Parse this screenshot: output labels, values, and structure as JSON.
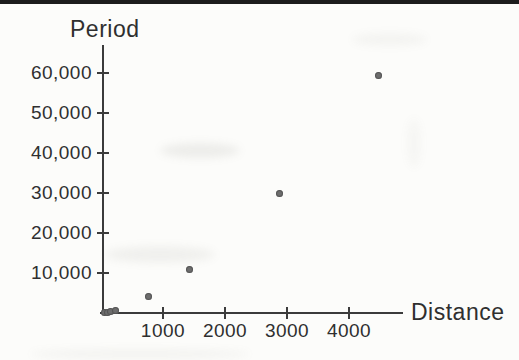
{
  "page": {
    "background_color": "#fcfcfa",
    "top_rule_color": "#1c1c1c",
    "text_color": "#2f2f2f",
    "axis_color": "#3b3b3b"
  },
  "chart_data": {
    "type": "scatter",
    "title": "",
    "xlabel": "Distance",
    "ylabel": "Period",
    "xlim": [
      0,
      4870
    ],
    "ylim": [
      0,
      67000
    ],
    "grid": false,
    "legend": false,
    "point_color": "#6e6e6e",
    "x_ticks": [
      {
        "value": 1000,
        "label": "1000"
      },
      {
        "value": 2000,
        "label": "2000"
      },
      {
        "value": 3000,
        "label": "3000"
      },
      {
        "value": 4000,
        "label": "4000"
      }
    ],
    "y_ticks": [
      {
        "value": 10000,
        "label": "10,000"
      },
      {
        "value": 20000,
        "label": "20,000"
      },
      {
        "value": 30000,
        "label": "30,000"
      },
      {
        "value": 40000,
        "label": "40,000"
      },
      {
        "value": 50000,
        "label": "50,000"
      },
      {
        "value": 60000,
        "label": "60,000"
      }
    ],
    "points": [
      {
        "x": 60,
        "y": 100
      },
      {
        "x": 110,
        "y": 230
      },
      {
        "x": 150,
        "y": 370
      },
      {
        "x": 230,
        "y": 690
      },
      {
        "x": 760,
        "y": 4100
      },
      {
        "x": 1430,
        "y": 10800
      },
      {
        "x": 2880,
        "y": 30000
      },
      {
        "x": 4480,
        "y": 59300
      }
    ]
  }
}
